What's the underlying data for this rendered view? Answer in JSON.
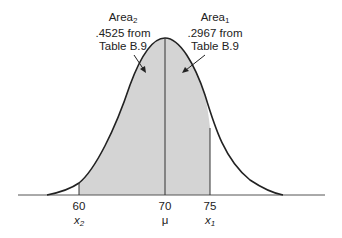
{
  "figure": {
    "type": "normal-distribution-area-diagram",
    "curve_color": "#222222",
    "shade_color": "#d4d4d4",
    "annotations": [
      {
        "id": "area2",
        "name": "Area",
        "subscript": "2",
        "line2": ".4525 from",
        "line3": "Table B.9"
      },
      {
        "id": "area1",
        "name": "Area",
        "subscript": "1",
        "line2": ".2967 from",
        "line3": "Table B.9"
      }
    ],
    "axis": {
      "ticks": [
        {
          "value": "60",
          "symbol": "x",
          "subscript": "2"
        },
        {
          "value": "70",
          "symbol": "μ",
          "subscript": ""
        },
        {
          "value": "75",
          "symbol": "x",
          "subscript": "1"
        }
      ]
    }
  }
}
